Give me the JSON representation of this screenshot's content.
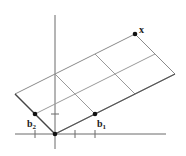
{
  "diagram": {
    "type": "lattice-parallelogram",
    "colors": {
      "grid": "#9a9a9a",
      "axis": "#6a6a6a",
      "edge": "#555555",
      "point": "#111111",
      "label": "#222222"
    },
    "origin": [
      55,
      134
    ],
    "basis": {
      "b1": [
        40,
        -20
      ],
      "b2": [
        -20,
        -20
      ]
    },
    "span": {
      "b1_count": 3,
      "b2_count": 2
    },
    "points": [
      {
        "id": "b1",
        "label": "b",
        "subscript": "1",
        "pos": [
          95,
          114
        ]
      },
      {
        "id": "b2",
        "label": "b",
        "subscript": "2",
        "pos": [
          35,
          114
        ]
      },
      {
        "id": "x",
        "label": "x",
        "subscript": "",
        "pos": [
          135,
          34
        ]
      }
    ]
  }
}
